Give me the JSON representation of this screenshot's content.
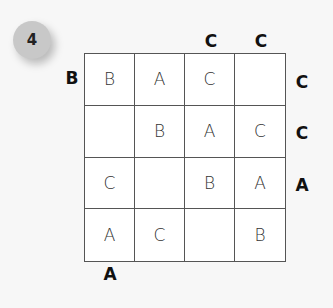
{
  "puzzle_number": "4",
  "grid": [
    [
      "B",
      "A",
      "C",
      ""
    ],
    [
      "",
      "B",
      "A",
      "C"
    ],
    [
      "C",
      "",
      "B",
      "A"
    ],
    [
      "A",
      "C",
      "",
      "B"
    ]
  ],
  "clues": {
    "top": [
      "",
      "",
      "C",
      "C"
    ],
    "right": [
      "C",
      "C",
      "A",
      ""
    ],
    "bottom": [
      "A",
      "",
      "",
      ""
    ],
    "left": [
      "B",
      "",
      "",
      ""
    ]
  }
}
